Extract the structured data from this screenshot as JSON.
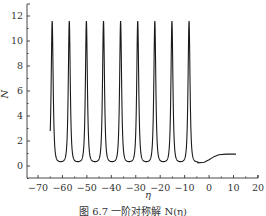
{
  "chart_data": {
    "type": "line",
    "title": "",
    "xlabel": "η",
    "ylabel": "N",
    "xlim": [
      -73,
      20
    ],
    "ylim": [
      -0.9,
      13.3
    ],
    "xticks": [
      -70,
      -60,
      -50,
      -40,
      -30,
      -20,
      -10,
      0,
      10,
      20
    ],
    "yticks": [
      0,
      2,
      4,
      6,
      8,
      10,
      12
    ],
    "xtick_labels": [
      "−70",
      "−60",
      "−50",
      "−40",
      "−30",
      "−20",
      "−10",
      "0",
      "10",
      "20"
    ],
    "ytick_labels": [
      "0",
      "2",
      "4",
      "6",
      "8",
      "10",
      "12"
    ],
    "grid": false,
    "legend": null,
    "series": [
      {
        "name": "N(η)",
        "color": "#1a1a1a",
        "start": {
          "x": -65,
          "y": 2.8
        },
        "peaks_x": [
          -64.2,
          -57.2,
          -50.2,
          -43.2,
          -36.2,
          -29.2,
          -22.2,
          -15.2,
          -8.2
        ],
        "peak_y": 11.6,
        "trough_y": 0.3,
        "tail": [
          {
            "x": -4.5,
            "y": 0.25
          },
          {
            "x": -2,
            "y": 0.3
          },
          {
            "x": 0,
            "y": 0.5
          },
          {
            "x": 2,
            "y": 0.75
          },
          {
            "x": 4,
            "y": 0.9
          },
          {
            "x": 7,
            "y": 0.95
          },
          {
            "x": 11,
            "y": 0.95
          }
        ]
      }
    ]
  },
  "caption": "图 6.7  一阶对称解 N(η)"
}
